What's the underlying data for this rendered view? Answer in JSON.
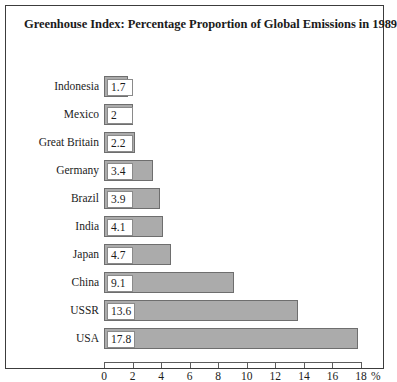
{
  "chart_data": {
    "type": "bar",
    "orientation": "horizontal",
    "title": "Greenhouse Index: Percentage Proportion of Global Emissions in 1989",
    "xlabel": "%",
    "ylabel": "",
    "categories": [
      "Indonesia",
      "Mexico",
      "Great Britain",
      "Germany",
      "Brazil",
      "India",
      "Japan",
      "China",
      "USSR",
      "USA"
    ],
    "values": [
      1.7,
      2,
      2.2,
      3.4,
      3.9,
      4.1,
      4.7,
      9.1,
      13.6,
      17.8
    ],
    "value_labels": [
      "1.7",
      "2",
      "2.2",
      "3.4",
      "3.9",
      "4.1",
      "4.7",
      "9.1",
      "13.6",
      "17.8"
    ],
    "xlim": [
      0,
      18
    ],
    "xticks": [
      0,
      2,
      4,
      6,
      8,
      10,
      12,
      14,
      16,
      18
    ],
    "xtick_labels": [
      "0",
      "2",
      "4",
      "6",
      "8",
      "10",
      "12",
      "14",
      "16",
      "18"
    ],
    "unit_suffix": "%",
    "grid": false,
    "legend": false,
    "bar_color": "#ababab",
    "bar_border_color": "#6e6e6e",
    "value_box_background": "#ffffff",
    "axis_color": "#5c5c5c",
    "text_color": "#1b1b1b",
    "frame_color": "#3c3c3c",
    "background": "#ffffff"
  }
}
